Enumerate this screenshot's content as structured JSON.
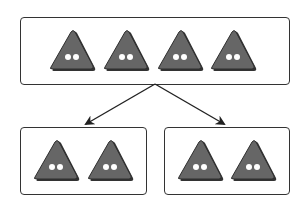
{
  "diagram": {
    "colors": {
      "button_fill": "#666666",
      "button_shadow": "#3a3a3a",
      "hole": "#ffffff",
      "line": "#222222"
    },
    "top_group": {
      "count": 4,
      "buttons": [
        {
          "cx": 72
        },
        {
          "cx": 126
        },
        {
          "cx": 180
        },
        {
          "cx": 233
        }
      ]
    },
    "bottom_left_group": {
      "count": 2,
      "buttons": [
        {
          "cx": 56
        },
        {
          "cx": 110
        }
      ]
    },
    "bottom_right_group": {
      "count": 2,
      "buttons": [
        {
          "cx": 200
        },
        {
          "cx": 253
        }
      ]
    },
    "arrows": [
      {
        "from": [
          155,
          84
        ],
        "to": [
          86,
          124
        ]
      },
      {
        "from": [
          155,
          84
        ],
        "to": [
          224,
          124
        ]
      }
    ]
  }
}
